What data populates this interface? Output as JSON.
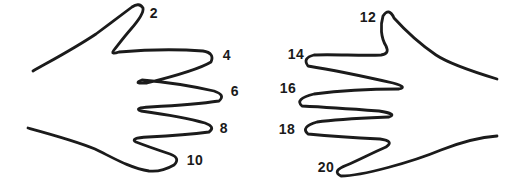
{
  "figure": {
    "background_color": "#ffffff",
    "outline_color": "#1b1b1b",
    "label_color": "#1a1a1a",
    "sequence": [
      2,
      4,
      6,
      8,
      10,
      12,
      14,
      16,
      18,
      20
    ],
    "left_hand": {
      "labels": [
        {
          "finger": "thumb",
          "value": "2"
        },
        {
          "finger": "index",
          "value": "4"
        },
        {
          "finger": "middle",
          "value": "6"
        },
        {
          "finger": "ring",
          "value": "8"
        },
        {
          "finger": "pinky",
          "value": "10"
        }
      ]
    },
    "right_hand": {
      "labels": [
        {
          "finger": "thumb",
          "value": "12"
        },
        {
          "finger": "index",
          "value": "14"
        },
        {
          "finger": "middle",
          "value": "16"
        },
        {
          "finger": "ring",
          "value": "18"
        },
        {
          "finger": "pinky",
          "value": "20"
        }
      ]
    }
  }
}
